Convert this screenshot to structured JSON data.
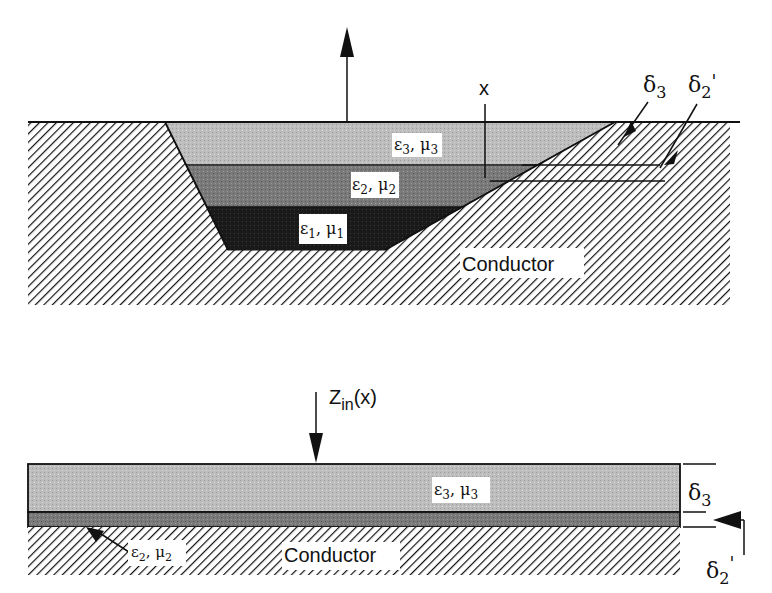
{
  "top_diagram": {
    "layers": [
      {
        "id": "layer3",
        "label": "ε3, μ3",
        "eps": "ε",
        "eps_sub": "3",
        "mu": "μ",
        "mu_sub": "3",
        "fill": "#bdbdbd"
      },
      {
        "id": "layer2",
        "label": "ε2, μ2",
        "eps": "ε",
        "eps_sub": "2",
        "mu": "μ",
        "mu_sub": "2",
        "fill": "#7a7a7a"
      },
      {
        "id": "layer1",
        "label": "ε1, μ1",
        "eps": "ε",
        "eps_sub": "1",
        "mu": "μ",
        "mu_sub": "1",
        "fill": "#1a1a1a"
      }
    ],
    "conductor_label": "Conductor",
    "position_label": "x",
    "delta3": {
      "sym": "δ",
      "sub": "3",
      "prime": ""
    },
    "delta2p": {
      "sym": "δ",
      "sub": "2",
      "prime": "'"
    },
    "up_arrow": "arrow-up"
  },
  "bottom_diagram": {
    "input_label": {
      "main": "Z",
      "sub": "in",
      "arg": "(x)"
    },
    "layer3": {
      "eps": "ε",
      "eps_sub": "3",
      "mu": "μ",
      "mu_sub": "3"
    },
    "layer2": {
      "eps": "ε",
      "eps_sub": "2",
      "mu": "μ",
      "mu_sub": "2"
    },
    "conductor_label": "Conductor",
    "delta3": {
      "sym": "δ",
      "sub": "3",
      "prime": ""
    },
    "delta2p": {
      "sym": "δ",
      "sub": "2",
      "prime": "'"
    }
  },
  "colors": {
    "layer3": "#bdbdbd",
    "layer2": "#7a7a7a",
    "layer1": "#1a1a1a",
    "hatch": "#111111",
    "background": "#ffffff"
  }
}
